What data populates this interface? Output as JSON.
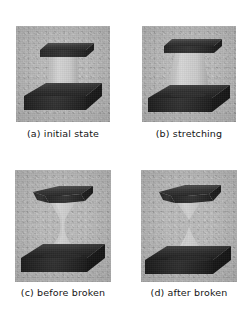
{
  "figure": {
    "type": "micrograph-sequence",
    "layout": "2x2-grid",
    "panel_count": 4,
    "colors": {
      "background": "#ffffff",
      "micrograph_background": "#b6b6b6",
      "dark_plate": "#2b2b2b",
      "dark_plate_shadow": "#1a1a1a",
      "specimen_light": "#c9c9c9",
      "caption_text": "#141414"
    },
    "panels": [
      {
        "id": "panel-a",
        "letter": "(a)",
        "title": "initial state",
        "caption": "(a) initial state",
        "stage": "initial",
        "description": "Cylindrical pillar specimen spanning between an upper flat punch plate and a lower substrate plate; no deformation."
      },
      {
        "id": "panel-b",
        "letter": "(b)",
        "title": "stretching",
        "caption": "(b) stretching",
        "stage": "stretching",
        "description": "Specimen elongated into an hourglass profile; uniform necking has begun at mid-height while both plates remain in contact."
      },
      {
        "id": "panel-c",
        "letter": "(c)",
        "title": "before broken",
        "caption": "(c) before broken",
        "stage": "before-fracture",
        "description": "Severe necking has reduced the mid-section to a thin filament immediately prior to rupture."
      },
      {
        "id": "panel-d",
        "letter": "(d)",
        "title": "after broken",
        "caption": "(d) after broken",
        "stage": "after-fracture",
        "description": "Filament has ruptured; two separated conical fracture tips remain attached to the upper and lower plates."
      }
    ]
  }
}
